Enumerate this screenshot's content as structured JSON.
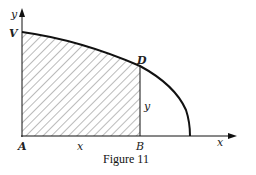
{
  "figure": {
    "caption": "Figure 11",
    "labels": {
      "y_axis": "y",
      "x_axis": "x",
      "origin": "A",
      "curve_start": "V",
      "curve_point": "D",
      "foot_point": "B",
      "segment_AB": "x",
      "segment_BD": "y"
    }
  },
  "colors": {
    "stroke": "#111111",
    "hatch": "#555555",
    "background": "#ffffff"
  }
}
